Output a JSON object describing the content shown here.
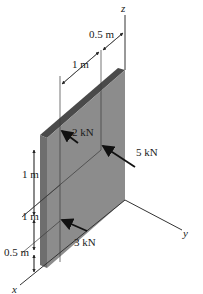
{
  "diagram": {
    "type": "3d-statics-plate",
    "axes": {
      "x": "x",
      "y": "y",
      "z": "z"
    },
    "dimensions": {
      "top_offset": "0.5 m",
      "top_width": "1 m",
      "vertical_upper": "1 m",
      "vertical_middle": "1 m",
      "vertical_lower": "0.5 m"
    },
    "forces": [
      {
        "label": "2 kN"
      },
      {
        "label": "5 kN"
      },
      {
        "label": "3 kN"
      }
    ],
    "colors": {
      "plate_face": "#8c8c8c",
      "plate_top": "#4a4a4a",
      "plate_side": "#6e6e6e",
      "lines": "#2a2a2a",
      "background": "#ffffff"
    }
  }
}
